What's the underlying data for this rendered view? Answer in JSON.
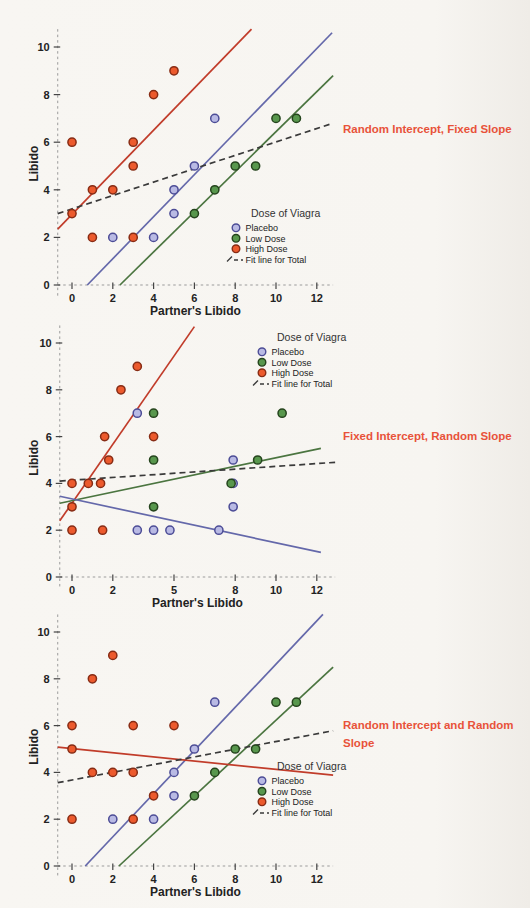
{
  "figure": {
    "background": "#f7f5f1"
  },
  "colors": {
    "placebo_fill": "#b9bae4",
    "placebo_edge": "#4c4c96",
    "low_dose_fill": "#58974d",
    "low_dose_edge": "#25441d",
    "high_dose_fill": "#ec5a2d",
    "high_dose_edge": "#872c15",
    "placebo_line": "#6468aa",
    "low_dose_line": "#4b7540",
    "high_dose_line": "#c13c2a",
    "total_fit_line": "#3a3a3a",
    "axis_line": "#9b9b9b",
    "tick_mark": "#444444",
    "tick_text": "#222222",
    "annotation_text": "#e8523a"
  },
  "annotations": [
    {
      "text": "Random Intercept, Fixed Slope"
    },
    {
      "text": "Fixed Intercept, Random Slope"
    },
    {
      "text": "Random Intercept and Random Slope"
    }
  ],
  "chart_data": [
    {
      "type": "scatter",
      "annotation": "Random Intercept, Fixed Slope",
      "xlabel": "Partner's Libido",
      "ylabel": "Libido",
      "x_ticks": [
        0,
        2,
        4,
        6,
        8,
        10,
        12
      ],
      "y_ticks": [
        0,
        2,
        4,
        6,
        8,
        10
      ],
      "xlim": [
        -0.7,
        12.8
      ],
      "ylim": [
        -0.45,
        10.75
      ],
      "grid": false,
      "legend": {
        "title": "Dose of Viagra",
        "position": "middle-right",
        "items": [
          {
            "label": "Placebo",
            "swatch": "placebo"
          },
          {
            "label": "Low Dose",
            "swatch": "low_dose"
          },
          {
            "label": "High Dose",
            "swatch": "high_dose"
          },
          {
            "label": "Fit line for Total",
            "swatch": "total_fit"
          }
        ]
      },
      "series": [
        {
          "name": "Placebo",
          "color_key": "placebo",
          "points": [
            [
              2,
              2
            ],
            [
              4,
              2
            ],
            [
              5,
              3
            ],
            [
              5,
              4
            ],
            [
              6,
              5
            ],
            [
              7,
              7
            ]
          ]
        },
        {
          "name": "Low Dose",
          "color_key": "low_dose",
          "points": [
            [
              6,
              3
            ],
            [
              7,
              4
            ],
            [
              8,
              5
            ],
            [
              9,
              5
            ],
            [
              10,
              7
            ],
            [
              11,
              7
            ]
          ]
        },
        {
          "name": "High Dose",
          "color_key": "high_dose",
          "points": [
            [
              0,
              3
            ],
            [
              0,
              6
            ],
            [
              1,
              2
            ],
            [
              1,
              4
            ],
            [
              2,
              4
            ],
            [
              3,
              2
            ],
            [
              3,
              5
            ],
            [
              3,
              6
            ],
            [
              4,
              8
            ],
            [
              5,
              9
            ]
          ]
        }
      ],
      "fit_lines": [
        {
          "name": "High Dose fit",
          "color_key": "high_dose_line",
          "dashed": false,
          "from": [
            -0.7,
            2.35
          ],
          "to": [
            8.8,
            10.75
          ]
        },
        {
          "name": "Placebo fit",
          "color_key": "placebo_line",
          "dashed": false,
          "from": [
            0.75,
            0
          ],
          "to": [
            12.75,
            10.6
          ]
        },
        {
          "name": "Low Dose fit",
          "color_key": "low_dose_line",
          "dashed": false,
          "from": [
            2.35,
            0
          ],
          "to": [
            12.8,
            8.8
          ]
        },
        {
          "name": "Fit line for Total",
          "color_key": "total_fit_line",
          "dashed": true,
          "from": [
            -0.7,
            3.0
          ],
          "to": [
            12.8,
            6.8
          ]
        }
      ]
    },
    {
      "type": "scatter",
      "annotation": "Fixed Intercept, Random Slope",
      "xlabel": "Partner's Libido",
      "ylabel": "Libido",
      "x_ticks": [
        0,
        2,
        5,
        8,
        10,
        12
      ],
      "y_ticks": [
        0,
        2,
        4,
        6,
        8,
        10
      ],
      "xlim": [
        -0.6,
        12.9
      ],
      "ylim": [
        -0.45,
        10.75
      ],
      "grid": false,
      "legend": {
        "title": "Dose of Viagra",
        "position": "top-right",
        "items": [
          {
            "label": "Placebo",
            "swatch": "placebo"
          },
          {
            "label": "Low Dose",
            "swatch": "low_dose"
          },
          {
            "label": "High Dose",
            "swatch": "high_dose"
          },
          {
            "label": "Fit line for Total",
            "swatch": "total_fit"
          }
        ]
      },
      "series": [
        {
          "name": "Placebo",
          "color_key": "placebo",
          "points": [
            [
              3.2,
              7
            ],
            [
              3.2,
              2
            ],
            [
              4,
              2
            ],
            [
              4.8,
              2
            ],
            [
              7.2,
              2
            ],
            [
              7.9,
              3
            ],
            [
              7.9,
              4
            ],
            [
              7.9,
              5
            ]
          ]
        },
        {
          "name": "Low Dose",
          "color_key": "low_dose",
          "points": [
            [
              4,
              3
            ],
            [
              4,
              5
            ],
            [
              4,
              7
            ],
            [
              7.8,
              4
            ],
            [
              9.1,
              5
            ],
            [
              10.3,
              7
            ]
          ]
        },
        {
          "name": "High Dose",
          "color_key": "high_dose",
          "points": [
            [
              0,
              2
            ],
            [
              0,
              3
            ],
            [
              0,
              4
            ],
            [
              0.8,
              4
            ],
            [
              1.4,
              4
            ],
            [
              1.5,
              2
            ],
            [
              1.6,
              6
            ],
            [
              1.8,
              5
            ],
            [
              2.4,
              8
            ],
            [
              3.2,
              9
            ],
            [
              4,
              6
            ]
          ]
        }
      ],
      "fit_lines": [
        {
          "name": "High Dose fit",
          "color_key": "high_dose_line",
          "dashed": false,
          "from": [
            -0.6,
            2.4
          ],
          "to": [
            6.0,
            10.7
          ]
        },
        {
          "name": "Low Dose fit",
          "color_key": "low_dose_line",
          "dashed": false,
          "from": [
            -0.6,
            3.15
          ],
          "to": [
            12.2,
            5.5
          ]
        },
        {
          "name": "Placebo fit",
          "color_key": "placebo_line",
          "dashed": false,
          "from": [
            -0.6,
            3.45
          ],
          "to": [
            12.2,
            1.05
          ]
        },
        {
          "name": "Fit line for Total",
          "color_key": "total_fit_line",
          "dashed": true,
          "from": [
            -0.6,
            4.1
          ],
          "to": [
            12.9,
            4.9
          ]
        }
      ]
    },
    {
      "type": "scatter",
      "annotation": "Random Intercept and Random Slope",
      "xlabel": "Partner's Libido",
      "ylabel": "Libido",
      "x_ticks": [
        0,
        2,
        4,
        6,
        8,
        10,
        12
      ],
      "y_ticks": [
        0,
        2,
        4,
        6,
        8,
        10
      ],
      "xlim": [
        -0.7,
        12.8
      ],
      "ylim": [
        -0.45,
        10.75
      ],
      "grid": false,
      "legend": {
        "title": "Dose of Viagra",
        "position": "bottom-right",
        "items": [
          {
            "label": "Placebo",
            "swatch": "placebo"
          },
          {
            "label": "Low Dose",
            "swatch": "low_dose"
          },
          {
            "label": "High Dose",
            "swatch": "high_dose"
          },
          {
            "label": "Fit line for Total",
            "swatch": "total_fit"
          }
        ]
      },
      "series": [
        {
          "name": "Placebo",
          "color_key": "placebo",
          "points": [
            [
              2,
              2
            ],
            [
              4,
              2
            ],
            [
              5,
              3
            ],
            [
              5,
              4
            ],
            [
              6,
              5
            ],
            [
              7,
              7
            ]
          ]
        },
        {
          "name": "Low Dose",
          "color_key": "low_dose",
          "points": [
            [
              6,
              3
            ],
            [
              7,
              4
            ],
            [
              8,
              5
            ],
            [
              9,
              5
            ],
            [
              10,
              7
            ],
            [
              11,
              7
            ]
          ]
        },
        {
          "name": "High Dose",
          "color_key": "high_dose",
          "points": [
            [
              0,
              2
            ],
            [
              0,
              5
            ],
            [
              0,
              6
            ],
            [
              1,
              4
            ],
            [
              1,
              8
            ],
            [
              2,
              4
            ],
            [
              2,
              9
            ],
            [
              3,
              2
            ],
            [
              3,
              4
            ],
            [
              3,
              6
            ],
            [
              4,
              3
            ],
            [
              5,
              6
            ]
          ]
        }
      ],
      "fit_lines": [
        {
          "name": "Placebo fit",
          "color_key": "placebo_line",
          "dashed": false,
          "from": [
            0.65,
            0
          ],
          "to": [
            12.3,
            10.75
          ]
        },
        {
          "name": "Low Dose fit",
          "color_key": "low_dose_line",
          "dashed": false,
          "from": [
            2.3,
            0
          ],
          "to": [
            12.8,
            8.5
          ]
        },
        {
          "name": "High Dose fit",
          "color_key": "high_dose_line",
          "dashed": false,
          "from": [
            -0.7,
            5.08
          ],
          "to": [
            12.8,
            3.88
          ]
        },
        {
          "name": "Fit line for Total",
          "color_key": "total_fit_line",
          "dashed": true,
          "from": [
            -0.7,
            3.56
          ],
          "to": [
            12.8,
            5.78
          ]
        }
      ]
    }
  ]
}
